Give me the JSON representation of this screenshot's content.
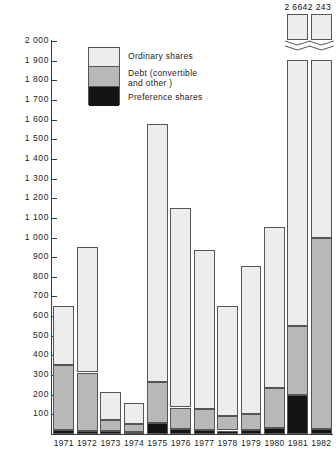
{
  "chart_data": {
    "type": "bar",
    "stacked": true,
    "title": "",
    "subtitle": "",
    "xlabel": "",
    "ylabel": "",
    "ylim": [
      0,
      2000
    ],
    "y_ticks": [
      100,
      200,
      300,
      400,
      500,
      600,
      700,
      800,
      900,
      1000,
      1100,
      1200,
      1300,
      1400,
      1500,
      1600,
      1700,
      1800,
      1900,
      2000
    ],
    "y_tick_labels": [
      "100",
      "200",
      "300",
      "400",
      "500",
      "600",
      "700",
      "800",
      "900",
      "1 000",
      "1 100",
      "1 200",
      "1 300",
      "1 400",
      "1 500",
      "1 600",
      "1 700",
      "1 800",
      "1 900",
      "2 000"
    ],
    "grid": false,
    "legend_position": "upper-left-inside",
    "categories": [
      "1971",
      "1972",
      "1973",
      "1974",
      "1975",
      "1976",
      "1977",
      "1978",
      "1979",
      "1980",
      "1981",
      "1982"
    ],
    "series": [
      {
        "name": "Preference shares",
        "color": "#141414",
        "values": [
          20,
          18,
          15,
          12,
          55,
          25,
          22,
          18,
          20,
          30,
          200,
          25
        ]
      },
      {
        "name": "Debt (convertible and other)",
        "color": "#b8b8b8",
        "values": [
          330,
          295,
          55,
          40,
          210,
          110,
          105,
          75,
          80,
          205,
          350,
          975
        ]
      },
      {
        "name": "Ordinary shares",
        "color": "#ececec",
        "values": [
          300,
          637,
          145,
          105,
          1315,
          1015,
          810,
          557,
          755,
          820,
          2114,
          1243
        ]
      }
    ],
    "totals": [
      650,
      950,
      215,
      157,
      1580,
      1150,
      937,
      650,
      855,
      1055,
      2664,
      2243
    ],
    "broken_bars": [
      {
        "category": "1981",
        "total": 2664,
        "label": "2664"
      },
      {
        "category": "1982",
        "total": 2243,
        "label": "2243"
      }
    ],
    "annotations": [
      "2 664",
      "2 243"
    ]
  },
  "legend": {
    "items": [
      {
        "key": "ordinary",
        "label": "Ordinary shares",
        "color": "#ececec"
      },
      {
        "key": "debt",
        "label": "Debt (convertible\nand other )",
        "color": "#b8b8b8"
      },
      {
        "key": "preference",
        "label": "Preference shares",
        "color": "#141414"
      }
    ]
  },
  "top_labels": {
    "bar_1981": "2 664",
    "bar_1982": "2 243"
  }
}
